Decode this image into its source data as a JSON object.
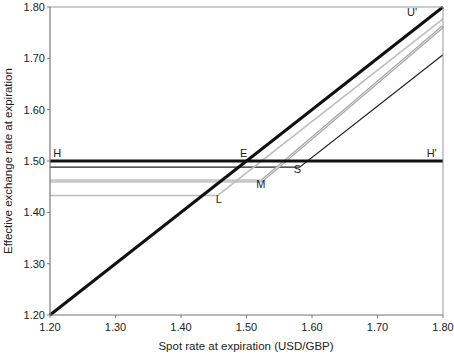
{
  "chart_data": {
    "type": "line",
    "title": "",
    "xlabel": "Spot rate at expiration (USD/GBP)",
    "ylabel": "Effective exchange rate at expiration",
    "xlim": [
      1.2,
      1.8
    ],
    "ylim": [
      1.2,
      1.8
    ],
    "x_ticks": [
      "1.20",
      "1.30",
      "1.40",
      "1.50",
      "1.60",
      "1.70",
      "1.80"
    ],
    "y_ticks": [
      "1.20",
      "1.30",
      "1.40",
      "1.50",
      "1.60",
      "1.70",
      "1.80"
    ],
    "grid": false,
    "legend": "none",
    "series": [
      {
        "name": "Unhedged (U')",
        "color": "#111111",
        "width": 3,
        "points": [
          [
            1.2,
            1.2
          ],
          [
            1.8,
            1.8
          ]
        ]
      },
      {
        "name": "Forward hedge (H-H')",
        "color": "#111111",
        "width": 3,
        "points": [
          [
            1.2,
            1.5
          ],
          [
            1.8,
            1.5
          ]
        ]
      },
      {
        "name": "Option S",
        "color": "#222222",
        "width": 1.2,
        "points": [
          [
            1.2,
            1.488
          ],
          [
            1.581,
            1.488
          ],
          [
            1.8,
            1.707
          ]
        ]
      },
      {
        "name": "Option M",
        "color": "#a9a9a9",
        "width": 3,
        "points": [
          [
            1.2,
            1.461
          ],
          [
            1.523,
            1.461
          ],
          [
            1.8,
            1.762
          ]
        ]
      },
      {
        "name": "Option L",
        "color": "#bdbdbd",
        "width": 1.5,
        "points": [
          [
            1.2,
            1.433
          ],
          [
            1.456,
            1.433
          ],
          [
            1.8,
            1.777
          ]
        ]
      }
    ],
    "annotations": [
      {
        "text": "H",
        "x": 1.205,
        "y": 1.508
      },
      {
        "text": "H'",
        "x": 1.775,
        "y": 1.508
      },
      {
        "text": "U'",
        "x": 1.745,
        "y": 1.782
      },
      {
        "text": "E",
        "x": 1.49,
        "y": 1.508
      },
      {
        "text": "S",
        "x": 1.572,
        "y": 1.476
      },
      {
        "text": "M",
        "x": 1.515,
        "y": 1.448
      },
      {
        "text": "L",
        "x": 1.453,
        "y": 1.419
      }
    ]
  }
}
